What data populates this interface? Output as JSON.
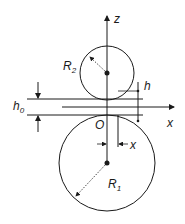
{
  "diagram": {
    "title": "",
    "labels": {
      "z_axis": "z",
      "x_axis": "x",
      "origin": "O",
      "r2": "R",
      "r2_sub": "2",
      "r1": "R",
      "r1_sub": "1",
      "h": "h",
      "h0": "h",
      "h0_sub": "0",
      "x_dim": "x"
    },
    "colors": {
      "stroke": "#1a1a1a",
      "background": "#ffffff"
    }
  }
}
